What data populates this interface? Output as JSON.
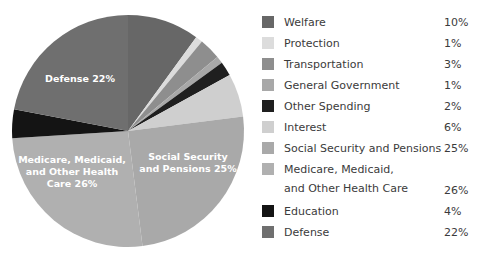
{
  "chart_data": {
    "type": "pie",
    "title": "",
    "categories": [
      "Welfare",
      "Protection",
      "Transportation",
      "General Government",
      "Other Spending",
      "Interest",
      "Social Security and Pensions",
      "Medicare, Medicaid,\nand Other Health Care",
      "Education",
      "Defense"
    ],
    "values": [
      10,
      1,
      3,
      1,
      2,
      6,
      25,
      26,
      4,
      22
    ],
    "value_labels": [
      "10%",
      "1%",
      "3%",
      "1%",
      "2%",
      "6%",
      "25%",
      "26%",
      "4%",
      "22%"
    ],
    "colors": [
      "#676767",
      "#dcdcdc",
      "#8e8e8e",
      "#a8a8a8",
      "#1f1f1f",
      "#cfcfcf",
      "#a9a9a9",
      "#b0b0b0",
      "#141414",
      "#6f6f6f"
    ],
    "start_angle_deg": 0,
    "direction": "clockwise",
    "legend_position": "right",
    "grid": false,
    "slice_labels": [
      {
        "key": "defense",
        "text": "Defense 22%",
        "lines": [
          "Defense 22%"
        ]
      },
      {
        "key": "medicare",
        "text": "Medicare, Medicaid, and Other Health Care 26%",
        "lines": [
          "Medicare, Medicaid,",
          "and Other Health",
          "Care 26%"
        ]
      },
      {
        "key": "social-security",
        "text": "Social Security and Pensions 25%",
        "lines": [
          "Social Security",
          "and Pensions 25%"
        ]
      }
    ]
  },
  "legend": {
    "rows": [
      {
        "label": "Welfare",
        "value": "10%",
        "color": "#676767"
      },
      {
        "label": "Protection",
        "value": "1%",
        "color": "#dcdcdc"
      },
      {
        "label": "Transportation",
        "value": "3%",
        "color": "#8e8e8e"
      },
      {
        "label": "General Government",
        "value": "1%",
        "color": "#a8a8a8"
      },
      {
        "label": "Other Spending",
        "value": "2%",
        "color": "#1f1f1f"
      },
      {
        "label": "Interest",
        "value": "6%",
        "color": "#cfcfcf"
      },
      {
        "label": "Social Security and Pensions",
        "value": "25%",
        "color": "#a9a9a9"
      },
      {
        "label": "Medicare, Medicaid,\nand Other Health Care",
        "value": "26%",
        "color": "#b0b0b0"
      },
      {
        "label": "Education",
        "value": "4%",
        "color": "#141414"
      },
      {
        "label": "Defense",
        "value": "22%",
        "color": "#6f6f6f"
      }
    ]
  },
  "pie_geometry": {
    "center_x": 128,
    "center_y": 131,
    "radius": 116
  }
}
